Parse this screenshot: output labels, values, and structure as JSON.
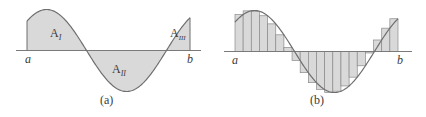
{
  "figure": {
    "panel_a": {
      "caption": "(a)",
      "axis_left_label": "a",
      "axis_right_label": "b",
      "region_labels": [
        {
          "base": "A",
          "sub": "I"
        },
        {
          "base": "A",
          "sub": "II"
        },
        {
          "base": "A",
          "sub": "III"
        }
      ]
    },
    "panel_b": {
      "caption": "(b)",
      "axis_left_label": "a",
      "axis_right_label": "b",
      "rectangle_count": 20
    },
    "colors": {
      "fill": "#d9d9d9",
      "curve": "#6e6e6e",
      "axis": "#7a7a7a",
      "rect_edge": "#8a8a8a",
      "text": "#3a3a3a"
    }
  }
}
